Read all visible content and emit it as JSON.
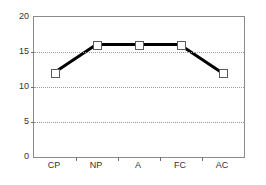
{
  "chart_data": {
    "type": "line",
    "title": "",
    "subtitle": "",
    "xlabel": "",
    "ylabel": "",
    "categories": [
      "CP",
      "NP",
      "A",
      "FC",
      "AC"
    ],
    "values": [
      12,
      16,
      16,
      16,
      12
    ],
    "series": [
      {
        "name": "",
        "values": [
          12,
          16,
          16,
          16,
          12
        ]
      }
    ],
    "ylim": [
      0,
      20
    ],
    "yticks": [
      0,
      5,
      10,
      15,
      20
    ],
    "ytick_labels": [
      "0",
      "5",
      "10",
      "15",
      "20"
    ],
    "gridlines": {
      "horizontal": [
        5,
        10,
        15
      ],
      "style": "dotted",
      "color": "#9a9a9a",
      "vertical": false
    },
    "legend": {
      "visible": false,
      "position": "none",
      "entries": []
    },
    "annotations": [],
    "style": {
      "line_color": "#000000",
      "line_width_px": 3,
      "marker": "square",
      "marker_fill": "#ffffff",
      "marker_edge": "#5a5a5a",
      "frame_color": "#8a8a8a",
      "background": "#ffffff",
      "text_color": "#333333"
    }
  }
}
